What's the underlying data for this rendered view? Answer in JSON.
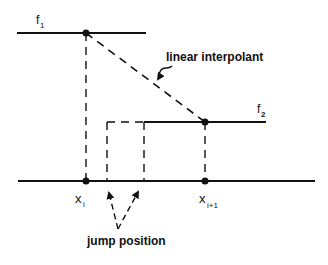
{
  "diagram": {
    "labels": {
      "f1": "f",
      "f1_sub": "1",
      "f2": "f",
      "f2_sub": "2",
      "linear_interpolant": "linear interpolant",
      "xi": "x",
      "xi_sub": "i",
      "xi1": "x",
      "xi1_sub": "i+1",
      "jump_position": "jump position"
    },
    "colors": {
      "line": "#111111",
      "background": "#ffffff"
    }
  }
}
